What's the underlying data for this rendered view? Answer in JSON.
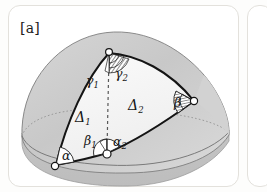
{
  "figure": {
    "panel_label": "[a]",
    "caption_absent": true
  },
  "colors": {
    "panel_border": "#e3e1dc",
    "surface_fill_outer": "#c9c9c9",
    "surface_fill_inner": "#f4f4f4",
    "stroke_dark": "#151515",
    "stroke_hidden": "#8d8d8d",
    "vertex_fill": "#ffffff",
    "background": "#ffffff"
  },
  "diagram": {
    "type": "spherical-triangle-decomposition",
    "regions": [
      {
        "name": "triangle-delta-1",
        "label": "Δ",
        "subscript": "1",
        "x": 74,
        "y": 112
      },
      {
        "name": "triangle-delta-2",
        "label": "Δ",
        "subscript": "2",
        "x": 127,
        "y": 100
      }
    ],
    "angles": [
      {
        "name": "angle-gamma-1",
        "label": "γ",
        "subscript": "1",
        "x": 83,
        "y": 76,
        "vertex": "apex"
      },
      {
        "name": "angle-gamma-2",
        "label": "γ",
        "subscript": "2",
        "x": 112,
        "y": 70,
        "vertex": "apex"
      },
      {
        "name": "angle-beta-1",
        "label": "β",
        "subscript": "1",
        "x": 82,
        "y": 137,
        "vertex": "base-middle"
      },
      {
        "name": "angle-alpha-2",
        "label": "α",
        "subscript": "2",
        "x": 109,
        "y": 138,
        "vertex": "base-middle"
      },
      {
        "name": "angle-alpha",
        "label": "α",
        "subscript": "",
        "x": 56,
        "y": 152,
        "vertex": "base-left"
      },
      {
        "name": "angle-beta",
        "label": "β",
        "subscript": "",
        "x": 172,
        "y": 98,
        "vertex": "right"
      }
    ],
    "vertices": [
      {
        "name": "vertex-apex",
        "x": 101,
        "y": 48
      },
      {
        "name": "vertex-base-left",
        "x": 48,
        "y": 160
      },
      {
        "name": "vertex-base-middle",
        "x": 99,
        "y": 148
      },
      {
        "name": "vertex-right",
        "x": 186,
        "y": 96
      }
    ],
    "dashed_segments": [
      {
        "name": "median-apex-to-base-middle",
        "from": "vertex-apex",
        "to": "vertex-base-middle"
      }
    ]
  }
}
